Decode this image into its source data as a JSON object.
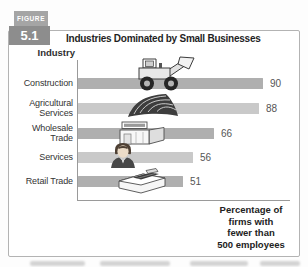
{
  "figure": {
    "tag_label": "FIGURE",
    "tag_number": "5.1",
    "title": "Industries Dominated by Small Businesses",
    "industry_header": "Industry",
    "caption_lines": [
      "Percentage of",
      "firms with",
      "fewer than",
      "500 employees"
    ]
  },
  "chart_data": {
    "type": "bar",
    "orientation": "horizontal",
    "title": "Industries Dominated by Small Businesses",
    "ylabel": "Industry",
    "xlabel": "Percentage of firms with fewer than 500 employees",
    "categories": [
      "Construction",
      "Agricultural Services",
      "Wholesale Trade",
      "Services",
      "Retail Trade"
    ],
    "values": [
      90,
      88,
      66,
      56,
      51
    ],
    "xlim": [
      0,
      100
    ],
    "grid": false,
    "legend": "none",
    "value_labels_shown": true,
    "bar_colors": [
      "#afafaf",
      "#c9c9c9",
      "#afafaf",
      "#c9c9c9",
      "#afafaf"
    ],
    "bar_icons": [
      "front-loader",
      "plowed-field",
      "warehouse-building",
      "person-bust",
      "cash-register"
    ]
  },
  "colors": {
    "figure_tag_bg": "#a5a5a5",
    "figure_number_bg": "#8d8d8d",
    "box_border": "#b3b3b3",
    "axis": "#9a9a9a",
    "bar_dark": "#afafaf",
    "bar_light": "#c9c9c9",
    "text": "#333333"
  }
}
